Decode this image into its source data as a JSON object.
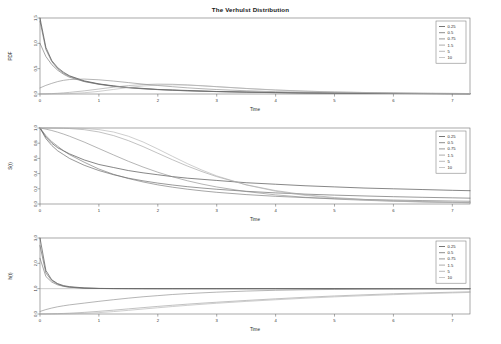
{
  "figure": {
    "title": "The Verhulst Distribution",
    "background_color": "#ffffff",
    "frame_color": "#6f6f6f",
    "width": 501,
    "height": 344
  },
  "legend": {
    "title": "",
    "entries": [
      {
        "label": "0.25",
        "color": "#3c3c3c"
      },
      {
        "label": "0.5",
        "color": "#5a5a5a"
      },
      {
        "label": "0.75",
        "color": "#6e6e6e"
      },
      {
        "label": "1.5",
        "color": "#878787"
      },
      {
        "label": "5",
        "color": "#9c9c9c"
      },
      {
        "label": "10",
        "color": "#b0b0b0"
      }
    ]
  },
  "chart_data": [
    {
      "type": "line",
      "title": "The Verhulst Distribution",
      "panel": "pdf",
      "xlabel": "Time",
      "ylabel": "PDF",
      "xlim": [
        0,
        7.3
      ],
      "ylim": [
        0,
        1.5
      ],
      "xticks": [
        0,
        1,
        2,
        3,
        4,
        5,
        6,
        7
      ],
      "yticks": [
        0.0,
        0.5,
        1.0,
        1.5
      ],
      "ytick_labels": [
        "0.0",
        "0.5",
        "1.0",
        "1.5"
      ],
      "grid": false,
      "legend_position": "top-right",
      "x": [
        0,
        0.1,
        0.2,
        0.3,
        0.4,
        0.5,
        0.75,
        1.0,
        1.25,
        1.5,
        1.75,
        2.0,
        2.25,
        2.5,
        2.75,
        3.0,
        3.5,
        4.0,
        4.5,
        5.0,
        5.5,
        6.0,
        6.5,
        7.0,
        7.3
      ],
      "series": [
        {
          "name": "0.25",
          "color": "#3c3c3c",
          "values": [
            1.5,
            0.92,
            0.66,
            0.52,
            0.43,
            0.36,
            0.26,
            0.2,
            0.16,
            0.13,
            0.11,
            0.09,
            0.08,
            0.07,
            0.06,
            0.05,
            0.04,
            0.03,
            0.02,
            0.018,
            0.014,
            0.011,
            0.009,
            0.007,
            0.006
          ]
        },
        {
          "name": "0.5",
          "color": "#5a5a5a",
          "values": [
            1.44,
            0.88,
            0.64,
            0.5,
            0.41,
            0.35,
            0.25,
            0.195,
            0.155,
            0.125,
            0.105,
            0.088,
            0.075,
            0.064,
            0.055,
            0.048,
            0.036,
            0.027,
            0.021,
            0.016,
            0.013,
            0.01,
            0.008,
            0.006,
            0.005
          ]
        },
        {
          "name": "0.75",
          "color": "#6e6e6e",
          "values": [
            1.0,
            0.74,
            0.58,
            0.47,
            0.39,
            0.33,
            0.245,
            0.19,
            0.152,
            0.123,
            0.102,
            0.086,
            0.073,
            0.062,
            0.054,
            0.047,
            0.035,
            0.026,
            0.02,
            0.016,
            0.012,
            0.01,
            0.008,
            0.006,
            0.005
          ]
        },
        {
          "name": "1.5",
          "color": "#878787",
          "values": [
            0.12,
            0.17,
            0.21,
            0.245,
            0.27,
            0.285,
            0.295,
            0.28,
            0.255,
            0.225,
            0.195,
            0.168,
            0.144,
            0.122,
            0.104,
            0.088,
            0.064,
            0.046,
            0.034,
            0.025,
            0.019,
            0.014,
            0.011,
            0.008,
            0.007
          ]
        },
        {
          "name": "5",
          "color": "#9c9c9c",
          "values": [
            0.002,
            0.004,
            0.008,
            0.014,
            0.022,
            0.032,
            0.062,
            0.098,
            0.135,
            0.166,
            0.186,
            0.195,
            0.192,
            0.18,
            0.163,
            0.144,
            0.108,
            0.078,
            0.056,
            0.04,
            0.029,
            0.021,
            0.015,
            0.011,
            0.009
          ]
        },
        {
          "name": "10",
          "color": "#b0b0b0",
          "values": [
            0.0,
            0.0,
            0.001,
            0.002,
            0.004,
            0.008,
            0.024,
            0.052,
            0.09,
            0.128,
            0.158,
            0.176,
            0.181,
            0.175,
            0.162,
            0.145,
            0.11,
            0.08,
            0.057,
            0.041,
            0.03,
            0.022,
            0.016,
            0.012,
            0.009
          ]
        }
      ]
    },
    {
      "type": "line",
      "panel": "survival",
      "xlabel": "Time",
      "ylabel": "S(t)",
      "xlim": [
        0,
        7.3
      ],
      "ylim": [
        0,
        1.0
      ],
      "xticks": [
        0,
        1,
        2,
        3,
        4,
        5,
        6,
        7
      ],
      "yticks": [
        0.0,
        0.2,
        0.4,
        0.6,
        0.8,
        1.0
      ],
      "ytick_labels": [
        "0.0",
        "0.2",
        "0.4",
        "0.6",
        "0.8",
        "1.0"
      ],
      "grid": false,
      "legend_position": "top-right",
      "x": [
        0,
        0.1,
        0.2,
        0.3,
        0.4,
        0.5,
        0.75,
        1.0,
        1.25,
        1.5,
        1.75,
        2.0,
        2.25,
        2.5,
        2.75,
        3.0,
        3.5,
        4.0,
        4.5,
        5.0,
        5.5,
        6.0,
        6.5,
        7.0,
        7.3
      ],
      "series": [
        {
          "name": "0.25",
          "color": "#3c3c3c",
          "values": [
            1.0,
            0.88,
            0.8,
            0.74,
            0.7,
            0.66,
            0.58,
            0.52,
            0.48,
            0.44,
            0.41,
            0.385,
            0.36,
            0.34,
            0.325,
            0.31,
            0.28,
            0.26,
            0.24,
            0.225,
            0.21,
            0.2,
            0.19,
            0.18,
            0.175
          ]
        },
        {
          "name": "0.5",
          "color": "#5a5a5a",
          "values": [
            1.0,
            0.86,
            0.77,
            0.7,
            0.65,
            0.6,
            0.51,
            0.44,
            0.385,
            0.34,
            0.305,
            0.275,
            0.25,
            0.228,
            0.21,
            0.194,
            0.167,
            0.146,
            0.13,
            0.117,
            0.106,
            0.096,
            0.088,
            0.081,
            0.077
          ]
        },
        {
          "name": "0.75",
          "color": "#6e6e6e",
          "values": [
            1.0,
            0.9,
            0.82,
            0.76,
            0.7,
            0.65,
            0.55,
            0.46,
            0.39,
            0.335,
            0.29,
            0.252,
            0.221,
            0.195,
            0.173,
            0.154,
            0.124,
            0.101,
            0.084,
            0.071,
            0.06,
            0.052,
            0.045,
            0.039,
            0.036
          ]
        },
        {
          "name": "1.5",
          "color": "#878787",
          "values": [
            1.0,
            0.985,
            0.967,
            0.945,
            0.92,
            0.892,
            0.815,
            0.73,
            0.645,
            0.562,
            0.486,
            0.418,
            0.358,
            0.306,
            0.262,
            0.224,
            0.164,
            0.12,
            0.088,
            0.065,
            0.049,
            0.037,
            0.028,
            0.021,
            0.018
          ]
        },
        {
          "name": "5",
          "color": "#9c9c9c",
          "values": [
            1.0,
            0.9998,
            0.9993,
            0.9982,
            0.996,
            0.993,
            0.978,
            0.948,
            0.9,
            0.834,
            0.755,
            0.668,
            0.582,
            0.5,
            0.426,
            0.36,
            0.253,
            0.176,
            0.122,
            0.085,
            0.06,
            0.043,
            0.031,
            0.022,
            0.018
          ]
        },
        {
          "name": "10",
          "color": "#b0b0b0",
          "values": [
            1.0,
            1.0,
            1.0,
            0.9999,
            0.9996,
            0.9988,
            0.994,
            0.979,
            0.947,
            0.892,
            0.816,
            0.724,
            0.627,
            0.532,
            0.446,
            0.37,
            0.251,
            0.168,
            0.113,
            0.077,
            0.053,
            0.037,
            0.026,
            0.019,
            0.015
          ]
        }
      ]
    },
    {
      "type": "line",
      "panel": "hazard",
      "xlabel": "Time",
      "ylabel": "h(t)",
      "xlim": [
        0,
        7.3
      ],
      "ylim": [
        0,
        3.0
      ],
      "xticks": [
        0,
        1,
        2,
        3,
        4,
        5,
        6,
        7
      ],
      "yticks": [
        0.0,
        1.0,
        2.0,
        3.0
      ],
      "ytick_labels": [
        "0.0",
        "1.0",
        "2.0",
        "3.0"
      ],
      "grid": false,
      "legend_position": "top-right",
      "reference_line": 1.0,
      "x": [
        0,
        0.1,
        0.2,
        0.3,
        0.4,
        0.5,
        0.75,
        1.0,
        1.25,
        1.5,
        1.75,
        2.0,
        2.25,
        2.5,
        2.75,
        3.0,
        3.5,
        4.0,
        4.5,
        5.0,
        5.5,
        6.0,
        6.5,
        7.0,
        7.3
      ],
      "series": [
        {
          "name": "0.25",
          "color": "#3c3c3c",
          "values": [
            3.0,
            1.72,
            1.35,
            1.2,
            1.12,
            1.08,
            1.03,
            1.01,
            1.005,
            1.002,
            1.001,
            1.0,
            1.0,
            1.0,
            1.0,
            1.0,
            1.0,
            1.0,
            1.0,
            1.0,
            1.0,
            1.0,
            1.0,
            1.0,
            1.0
          ]
        },
        {
          "name": "0.5",
          "color": "#5a5a5a",
          "values": [
            2.7,
            1.62,
            1.32,
            1.18,
            1.1,
            1.06,
            1.02,
            1.008,
            1.003,
            1.001,
            1.0,
            1.0,
            1.0,
            1.0,
            1.0,
            1.0,
            1.0,
            1.0,
            1.0,
            1.0,
            1.0,
            1.0,
            1.0,
            1.0,
            1.0
          ]
        },
        {
          "name": "0.75",
          "color": "#6e6e6e",
          "values": [
            2.2,
            1.48,
            1.26,
            1.15,
            1.09,
            1.055,
            1.02,
            1.007,
            1.002,
            1.001,
            1.0,
            1.0,
            1.0,
            1.0,
            1.0,
            1.0,
            1.0,
            1.0,
            1.0,
            1.0,
            1.0,
            1.0,
            1.0,
            1.0,
            1.0
          ]
        },
        {
          "name": "1.5",
          "color": "#878787",
          "values": [
            0.1,
            0.175,
            0.235,
            0.285,
            0.325,
            0.36,
            0.43,
            0.5,
            0.565,
            0.625,
            0.68,
            0.725,
            0.77,
            0.805,
            0.835,
            0.862,
            0.905,
            0.935,
            0.956,
            0.97,
            0.98,
            0.987,
            0.991,
            0.994,
            0.996
          ]
        },
        {
          "name": "5",
          "color": "#9c9c9c",
          "values": [
            0.002,
            0.004,
            0.008,
            0.014,
            0.022,
            0.032,
            0.064,
            0.105,
            0.152,
            0.202,
            0.252,
            0.3,
            0.345,
            0.388,
            0.428,
            0.465,
            0.535,
            0.6,
            0.66,
            0.712,
            0.758,
            0.798,
            0.832,
            0.86,
            0.878
          ]
        },
        {
          "name": "10",
          "color": "#b0b0b0",
          "values": [
            0.0,
            0.0,
            0.001,
            0.002,
            0.004,
            0.008,
            0.024,
            0.054,
            0.096,
            0.145,
            0.196,
            0.246,
            0.295,
            0.341,
            0.384,
            0.424,
            0.497,
            0.562,
            0.622,
            0.676,
            0.722,
            0.764,
            0.8,
            0.832,
            0.852
          ]
        }
      ]
    }
  ]
}
